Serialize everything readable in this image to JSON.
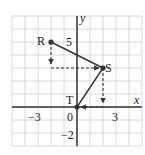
{
  "chart_data": {
    "type": "scatter",
    "title": "",
    "xlabel": "x",
    "ylabel": "y",
    "xlim": [
      -5,
      5
    ],
    "ylim": [
      -3,
      7
    ],
    "grid": true,
    "x_ticks": [
      {
        "value": -3,
        "label": "−3"
      },
      {
        "value": 0,
        "label": "0"
      },
      {
        "value": 3,
        "label": "3"
      }
    ],
    "y_ticks": [
      {
        "value": 5,
        "label": "5"
      },
      {
        "value": -2,
        "label": "−2"
      }
    ],
    "points": [
      {
        "label": "R",
        "x": -2,
        "y": 5
      },
      {
        "label": "S",
        "x": 2,
        "y": 3
      },
      {
        "label": "T",
        "x": 0,
        "y": 0
      }
    ],
    "segments": [
      {
        "from": "R",
        "to": "S",
        "style": "solid"
      },
      {
        "from": "S",
        "to": "T",
        "style": "solid"
      }
    ],
    "dashed_arrows": [
      {
        "from": [
          -2,
          5
        ],
        "to": [
          -2,
          3
        ],
        "direction": "down"
      },
      {
        "from": [
          -2,
          3
        ],
        "to": [
          2,
          3
        ],
        "direction": "right"
      },
      {
        "from": [
          2,
          3
        ],
        "to": [
          2,
          0
        ],
        "direction": "down"
      },
      {
        "from": [
          2,
          0
        ],
        "to": [
          0,
          0
        ],
        "direction": "left"
      }
    ]
  },
  "labels": {
    "x_axis": "x",
    "y_axis": "y",
    "R": "R",
    "S": "S",
    "T": "T",
    "tick_neg3": "−3",
    "tick_0": "0",
    "tick_3": "3",
    "tick_5": "5",
    "tick_neg2": "−2"
  },
  "colors": {
    "grid": "#d0d0d0",
    "axis": "#333333",
    "line": "#333333"
  }
}
